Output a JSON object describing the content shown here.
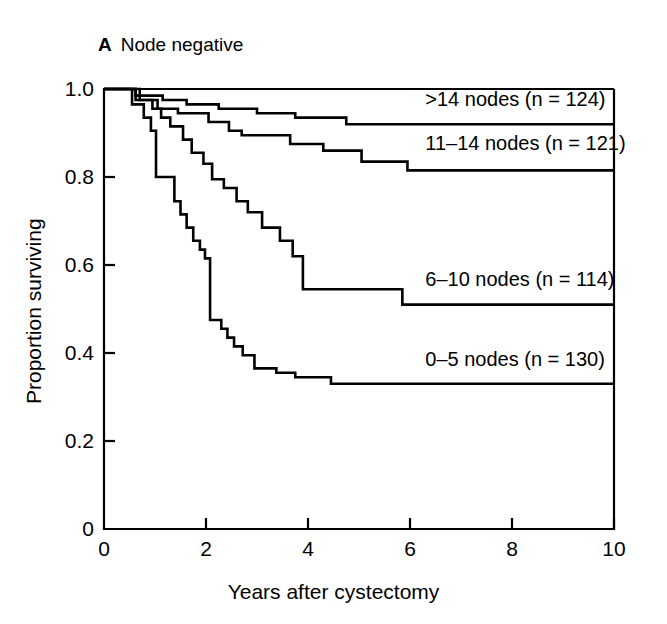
{
  "figure": {
    "panel_letter": "A",
    "panel_title": "Node negative"
  },
  "chart_data": {
    "type": "line",
    "subtype": "kaplan-meier-step",
    "title": "Node negative",
    "panel": "A",
    "xlabel": "Years after cystectomy",
    "ylabel": "Proportion surviving",
    "xlim": [
      0,
      10
    ],
    "ylim": [
      0,
      1.0
    ],
    "xticks": [
      0,
      2,
      4,
      6,
      8,
      10
    ],
    "xtick_labels": [
      "0",
      "2",
      "4",
      "6",
      "8",
      "10"
    ],
    "yticks": [
      0,
      0.2,
      0.4,
      0.6,
      0.8,
      1.0
    ],
    "ytick_labels": [
      "0",
      "0.2",
      "0.4",
      "0.6",
      "0.8",
      "1.0"
    ],
    "grid": false,
    "legend": "inline-curve-labels",
    "tick_direction": "in",
    "line_color": "#000000",
    "series": [
      {
        "name": ">14 nodes (n = 124)",
        "group": ">14 nodes",
        "n": 124,
        "label": ">14 nodes (n = 124)",
        "label_x": 6.3,
        "label_y": 0.975,
        "final_value": 0.92,
        "steps": [
          [
            0.0,
            1.0
          ],
          [
            0.62,
            1.0
          ],
          [
            0.62,
            0.985
          ],
          [
            1.15,
            0.985
          ],
          [
            1.15,
            0.975
          ],
          [
            1.62,
            0.975
          ],
          [
            1.62,
            0.965
          ],
          [
            2.25,
            0.965
          ],
          [
            2.25,
            0.955
          ],
          [
            3.0,
            0.955
          ],
          [
            3.0,
            0.945
          ],
          [
            3.75,
            0.945
          ],
          [
            3.75,
            0.935
          ],
          [
            4.75,
            0.935
          ],
          [
            4.75,
            0.92
          ],
          [
            10.0,
            0.92
          ]
        ]
      },
      {
        "name": "11–14 nodes (n = 121)",
        "group": "11–14 nodes",
        "n": 121,
        "label": "11–14 nodes (n = 121)",
        "label_x": 6.3,
        "label_y": 0.875,
        "final_value": 0.815,
        "steps": [
          [
            0.0,
            1.0
          ],
          [
            0.7,
            1.0
          ],
          [
            0.7,
            0.975
          ],
          [
            1.05,
            0.975
          ],
          [
            1.05,
            0.955
          ],
          [
            1.45,
            0.955
          ],
          [
            1.45,
            0.945
          ],
          [
            2.05,
            0.945
          ],
          [
            2.05,
            0.925
          ],
          [
            2.45,
            0.925
          ],
          [
            2.45,
            0.905
          ],
          [
            2.7,
            0.905
          ],
          [
            2.7,
            0.895
          ],
          [
            3.65,
            0.895
          ],
          [
            3.65,
            0.875
          ],
          [
            4.3,
            0.875
          ],
          [
            4.3,
            0.86
          ],
          [
            5.05,
            0.86
          ],
          [
            5.05,
            0.835
          ],
          [
            5.95,
            0.835
          ],
          [
            5.95,
            0.815
          ],
          [
            10.0,
            0.815
          ]
        ]
      },
      {
        "name": "6–10 nodes (n = 114)",
        "group": "6–10 nodes",
        "n": 114,
        "label": "6–10 nodes (n = 114)",
        "label_x": 6.3,
        "label_y": 0.565,
        "final_value": 0.51,
        "steps": [
          [
            0.0,
            1.0
          ],
          [
            0.62,
            1.0
          ],
          [
            0.62,
            0.975
          ],
          [
            0.95,
            0.975
          ],
          [
            0.95,
            0.955
          ],
          [
            1.12,
            0.955
          ],
          [
            1.12,
            0.935
          ],
          [
            1.3,
            0.935
          ],
          [
            1.3,
            0.915
          ],
          [
            1.55,
            0.915
          ],
          [
            1.55,
            0.885
          ],
          [
            1.72,
            0.885
          ],
          [
            1.72,
            0.855
          ],
          [
            1.95,
            0.855
          ],
          [
            1.95,
            0.83
          ],
          [
            2.12,
            0.83
          ],
          [
            2.12,
            0.795
          ],
          [
            2.35,
            0.795
          ],
          [
            2.35,
            0.775
          ],
          [
            2.6,
            0.775
          ],
          [
            2.6,
            0.745
          ],
          [
            2.82,
            0.745
          ],
          [
            2.82,
            0.72
          ],
          [
            3.1,
            0.72
          ],
          [
            3.1,
            0.685
          ],
          [
            3.45,
            0.685
          ],
          [
            3.45,
            0.655
          ],
          [
            3.7,
            0.655
          ],
          [
            3.7,
            0.62
          ],
          [
            3.9,
            0.62
          ],
          [
            3.9,
            0.545
          ],
          [
            5.85,
            0.545
          ],
          [
            5.85,
            0.51
          ],
          [
            10.0,
            0.51
          ]
        ]
      },
      {
        "name": "0–5 nodes (n = 130)",
        "group": "0–5 nodes",
        "n": 130,
        "label": "0–5 nodes (n = 130)",
        "label_x": 6.3,
        "label_y": 0.385,
        "final_value": 0.33,
        "steps": [
          [
            0.0,
            1.0
          ],
          [
            0.55,
            1.0
          ],
          [
            0.55,
            0.965
          ],
          [
            0.78,
            0.965
          ],
          [
            0.78,
            0.935
          ],
          [
            0.92,
            0.935
          ],
          [
            0.92,
            0.905
          ],
          [
            1.02,
            0.905
          ],
          [
            1.02,
            0.8
          ],
          [
            1.38,
            0.8
          ],
          [
            1.38,
            0.745
          ],
          [
            1.5,
            0.745
          ],
          [
            1.5,
            0.715
          ],
          [
            1.62,
            0.715
          ],
          [
            1.62,
            0.685
          ],
          [
            1.75,
            0.685
          ],
          [
            1.75,
            0.655
          ],
          [
            1.88,
            0.655
          ],
          [
            1.88,
            0.635
          ],
          [
            1.98,
            0.635
          ],
          [
            1.98,
            0.615
          ],
          [
            2.08,
            0.615
          ],
          [
            2.08,
            0.475
          ],
          [
            2.3,
            0.475
          ],
          [
            2.3,
            0.455
          ],
          [
            2.42,
            0.455
          ],
          [
            2.42,
            0.435
          ],
          [
            2.55,
            0.435
          ],
          [
            2.55,
            0.415
          ],
          [
            2.72,
            0.415
          ],
          [
            2.72,
            0.395
          ],
          [
            2.95,
            0.395
          ],
          [
            2.95,
            0.365
          ],
          [
            3.38,
            0.365
          ],
          [
            3.38,
            0.355
          ],
          [
            3.75,
            0.355
          ],
          [
            3.75,
            0.345
          ],
          [
            4.45,
            0.345
          ],
          [
            4.45,
            0.33
          ],
          [
            10.0,
            0.33
          ]
        ]
      }
    ]
  }
}
